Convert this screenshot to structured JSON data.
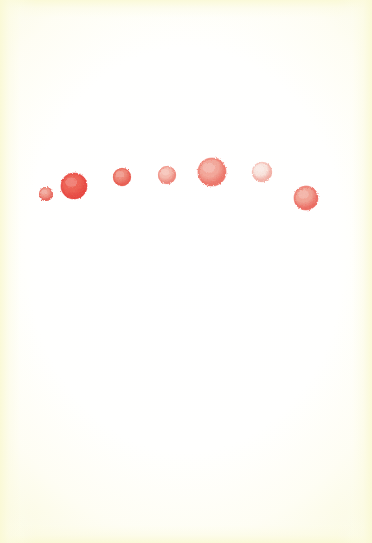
{
  "artwork": {
    "title": "Watercolor Dots",
    "width": 372,
    "height": 543,
    "medium": "watercolor on paper",
    "composition": "seven red-to-pink dots arranged in a shallow arc across the upper third",
    "background": {
      "paper_color": "#fffffd",
      "edge_tint_color": "#faf9d6",
      "edge_tint_width_px": 13
    }
  },
  "chart_data": {
    "type": "scatter",
    "xlabel": "",
    "ylabel": "",
    "xlim": [
      0,
      372
    ],
    "ylim": [
      543,
      0
    ],
    "grid": false,
    "legend": null,
    "series": [
      {
        "name": "dots",
        "points": [
          {
            "id": "dot-1",
            "label": "small red dot",
            "x": 46,
            "y": 194,
            "r": 7,
            "rim": "#e8574c",
            "core": "#f2907f",
            "opacity": 0.95
          },
          {
            "id": "dot-2",
            "label": "large saturated red dot",
            "x": 74,
            "y": 186,
            "r": 13,
            "rim": "#ea4038",
            "core": "#f05a4c",
            "opacity": 1.0
          },
          {
            "id": "dot-3",
            "label": "medium red dot",
            "x": 122,
            "y": 177,
            "r": 9,
            "rim": "#ea5246",
            "core": "#f17f6e",
            "opacity": 0.97
          },
          {
            "id": "dot-4",
            "label": "medium pink dot",
            "x": 167,
            "y": 175,
            "r": 9,
            "rim": "#ef796c",
            "core": "#f7b2a4",
            "opacity": 0.92
          },
          {
            "id": "dot-5",
            "label": "large coral dot",
            "x": 212,
            "y": 172,
            "r": 14,
            "rim": "#ee6a5c",
            "core": "#f6a091",
            "opacity": 0.95
          },
          {
            "id": "dot-6",
            "label": "pale pink dot",
            "x": 262,
            "y": 172,
            "r": 10,
            "rim": "#f2a296",
            "core": "#fbe2da",
            "opacity": 0.88
          },
          {
            "id": "dot-7",
            "label": "medium coral dot",
            "x": 306,
            "y": 198,
            "r": 12,
            "rim": "#ec6155",
            "core": "#f49b8b",
            "opacity": 0.95
          }
        ]
      }
    ]
  }
}
